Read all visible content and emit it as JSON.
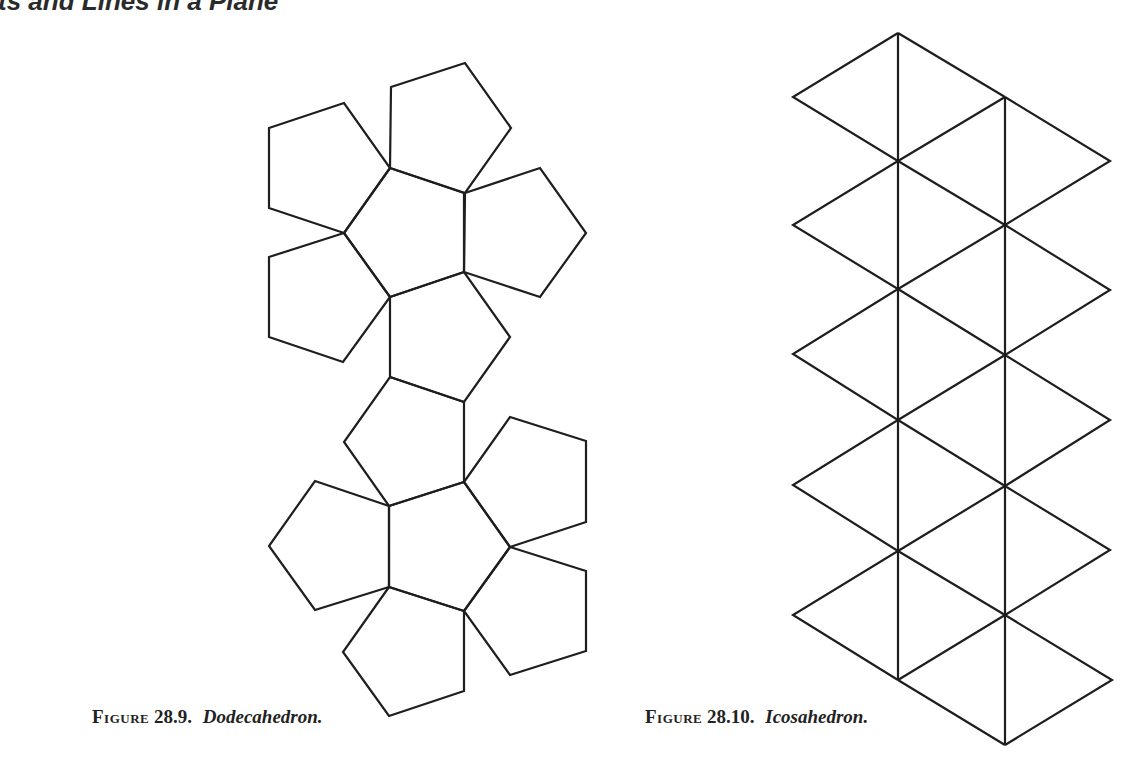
{
  "page": {
    "running_head": "ts and Lines in a Plane"
  },
  "figures": [
    {
      "label": "Figure",
      "number": "28.9.",
      "title": "Dodecahedron.",
      "description": "Net of a dodecahedron: 12 regular pentagons in two flower-shaped clusters of six, joined at one edge"
    },
    {
      "label": "Figure",
      "number": "28.10.",
      "title": "Icosahedron.",
      "description": "Net of an icosahedron: 20 equilateral triangles arranged in a zig-zag strip between two vertical lines"
    }
  ],
  "colors": {
    "background": "#ffffff",
    "ink": "#1e1e1e"
  }
}
